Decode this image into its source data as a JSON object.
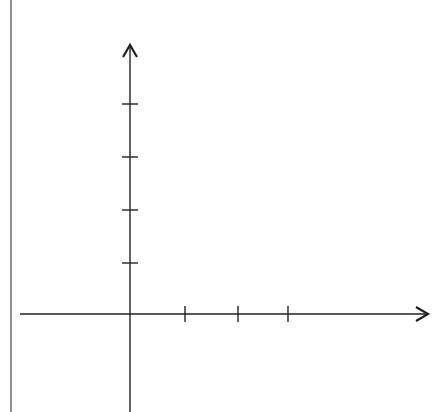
{
  "diagram": {
    "type": "coordinate-axes",
    "stroke_color": "#222222",
    "border_line": {
      "x": 11,
      "y1": 0,
      "y2": 412
    },
    "y_axis": {
      "x": 130,
      "top": 45,
      "bottom": 412,
      "ticks_y": [
        104,
        157,
        210,
        263
      ],
      "tick_count": 4,
      "arrow": "up"
    },
    "x_axis": {
      "y": 314,
      "left": 20,
      "right": 428,
      "ticks_x": [
        185,
        238,
        288
      ],
      "tick_count": 3,
      "arrow": "right"
    },
    "labels": []
  }
}
